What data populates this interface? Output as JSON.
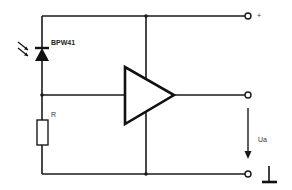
{
  "diagram": {
    "type": "circuit-schematic",
    "components": {
      "photodiode": {
        "label": "BPW41"
      },
      "resistor": {
        "label": "R"
      },
      "amplifier": {
        "label": ""
      }
    },
    "terminals": {
      "supply": {
        "label": "+"
      },
      "output_voltage": {
        "label": "Ua"
      },
      "ground": {
        "label": ""
      }
    },
    "colors": {
      "line": "#1a1a1a",
      "background": "#ffffff"
    }
  }
}
